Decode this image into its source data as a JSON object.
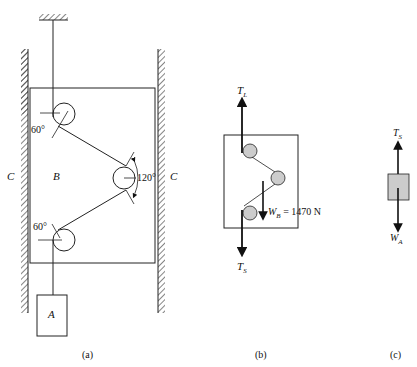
{
  "figure_a": {
    "caption": "(a)",
    "wall_left_label": "C",
    "wall_right_label": "C",
    "box_label": "B",
    "block_label": "A",
    "angle_top": "60°",
    "angle_right": "120°",
    "angle_bottom": "60°"
  },
  "figure_b": {
    "caption": "(b)",
    "top_force": "T",
    "top_force_sub": "L",
    "bottom_force": "T",
    "bottom_force_sub": "S",
    "weight_label": "W",
    "weight_sub": "B",
    "weight_value": " = 1470 N"
  },
  "figure_c": {
    "caption": "(c)",
    "top_force": "T",
    "top_force_sub": "S",
    "bottom_force": "W",
    "bottom_force_sub": "A"
  }
}
